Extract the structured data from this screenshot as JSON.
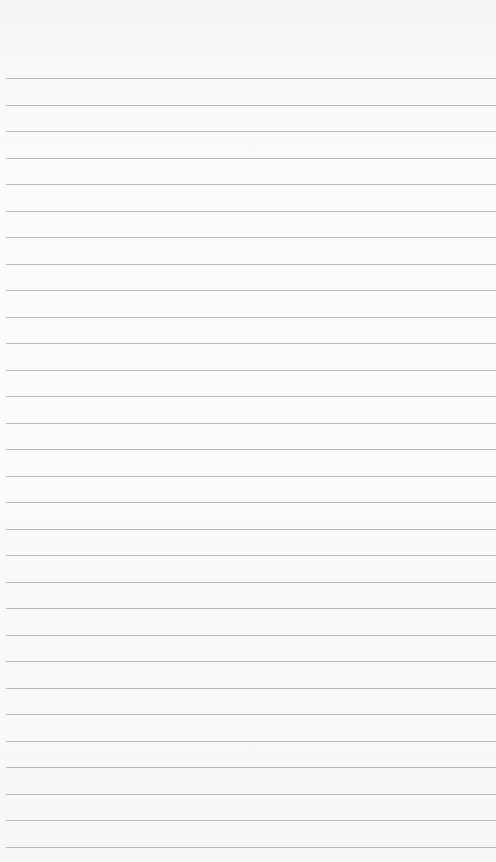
{
  "paper": {
    "type": "lined notepad",
    "background_color": "#fafafa",
    "line_color": "#a9a9a9",
    "line_count": 30,
    "first_line_y": 78,
    "line_spacing": 26.5
  }
}
